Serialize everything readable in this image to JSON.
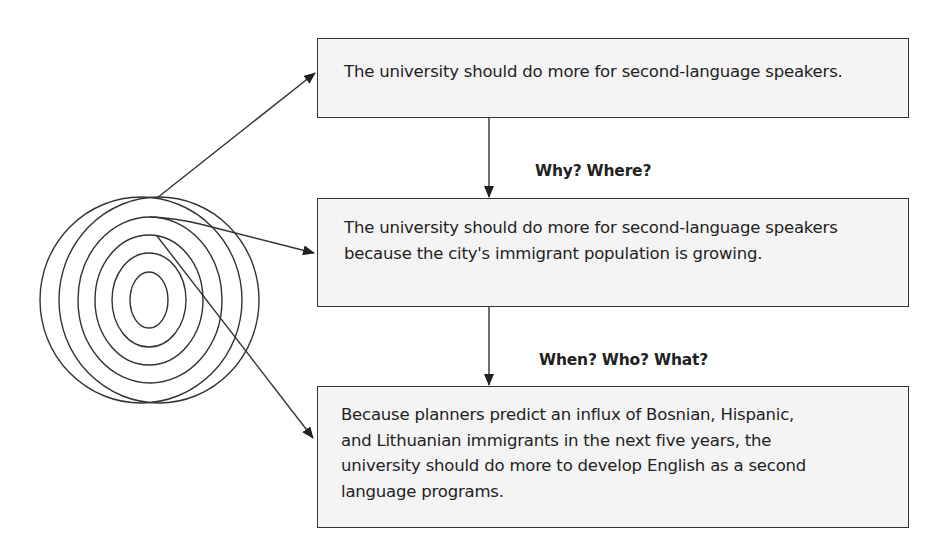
{
  "diagram": {
    "boxes": [
      {
        "id": "box-1",
        "text": "The university should do more for second-language speakers."
      },
      {
        "id": "box-2",
        "text": "The university should do more for second-language speakers because the city's immigrant population is growing."
      },
      {
        "id": "box-3",
        "text": "Because planners predict an influx of Bosnian, Hispanic, and Lithuanian immigrants in the next five years, the university should do more to develop English as a second language programs."
      }
    ],
    "connector_labels": [
      {
        "id": "label-1",
        "text": "Why? Where?"
      },
      {
        "id": "label-2",
        "text": "When? Who? What?"
      }
    ],
    "target_icon": {
      "name": "concentric-target",
      "rings": 6
    },
    "colors": {
      "line": "#333333",
      "box_fill": "#f4f4f4",
      "text": "#222222"
    }
  }
}
